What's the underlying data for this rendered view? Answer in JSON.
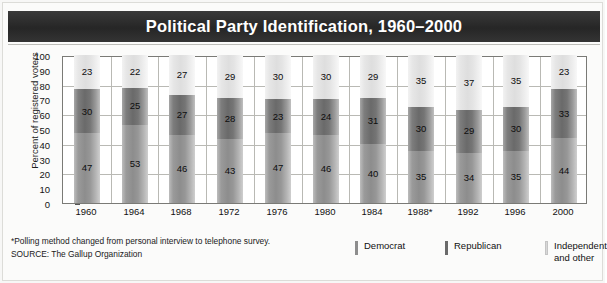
{
  "title": "Political Party Identification, 1960–2000",
  "axis": {
    "ylabel": "Percent of registered voters",
    "yticks": [
      "0",
      "10",
      "20",
      "30",
      "40",
      "50",
      "60",
      "70",
      "80",
      "90",
      "100"
    ]
  },
  "notes": {
    "footnote": "*Polling method changed from personal interview to telephone survey.",
    "source": "SOURCE: The Gallup Organization"
  },
  "legend": {
    "democrat": "Democrat",
    "republican": "Republican",
    "independent_line1": "Independent",
    "independent_line2": "and other"
  },
  "colors": {
    "democrat": "#8d8d8d",
    "republican": "#6a6a6a",
    "independent": "#e2e2e2",
    "title_band": "#2e2e2e",
    "grid": "#b9b9b4"
  },
  "chart_data": {
    "type": "bar",
    "title": "Political Party Identification, 1960–2000",
    "subtitle": "",
    "xlabel": "",
    "ylabel": "Percent of registered voters",
    "ylim": [
      0,
      100
    ],
    "ytick_step": 10,
    "gridline_step": 20,
    "grid": true,
    "stacked": true,
    "legend_position": "bottom-right",
    "categories": [
      "1960",
      "1964",
      "1968",
      "1972",
      "1976",
      "1980",
      "1984",
      "1988*",
      "1992",
      "1996",
      "2000"
    ],
    "series": [
      {
        "name": "Democrat",
        "values": [
          47,
          53,
          46,
          43,
          47,
          46,
          40,
          35,
          34,
          35,
          44
        ]
      },
      {
        "name": "Republican",
        "values": [
          30,
          25,
          27,
          28,
          23,
          24,
          31,
          30,
          29,
          30,
          33
        ]
      },
      {
        "name": "Independent and other",
        "values": [
          23,
          22,
          27,
          29,
          30,
          30,
          29,
          35,
          37,
          35,
          23
        ]
      }
    ],
    "annotations": [
      "*Polling method changed from personal interview to telephone survey.",
      "SOURCE: The Gallup Organization"
    ]
  }
}
